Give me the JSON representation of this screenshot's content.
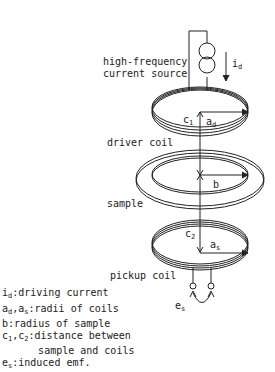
{
  "diagram": {
    "title": "",
    "components": {
      "source_label_line1": "high-frequency",
      "source_label_line2": "current source",
      "current_symbol": "i",
      "current_sub": "d",
      "driver_coil_label": "driver coil",
      "sample_label": "sample",
      "pickup_coil_label": "pickup coil",
      "c1": "c",
      "c1_sub": "1",
      "ad": "a",
      "ad_sub": "d",
      "b": "b",
      "c2": "c",
      "c2_sub": "2",
      "as": "a",
      "as_sub": "s",
      "es": "e",
      "es_sub": "s"
    },
    "legend": [
      {
        "sym": "i",
        "sub": "d",
        "text": ":driving current"
      },
      {
        "sym": "a",
        "sub": "d",
        "sym2": ",a",
        "sub2": "s",
        "text": ":radii of coils"
      },
      {
        "sym": "b",
        "sub": "",
        "text": ":radius of sample"
      },
      {
        "sym": "c",
        "sub": "1",
        "sym2": ",c",
        "sub2": "2",
        "text": ":distance between"
      },
      {
        "sym": "",
        "sub": "",
        "text": "      sample and coils"
      },
      {
        "sym": "e",
        "sub": "s",
        "text": ":induced emf."
      }
    ]
  }
}
